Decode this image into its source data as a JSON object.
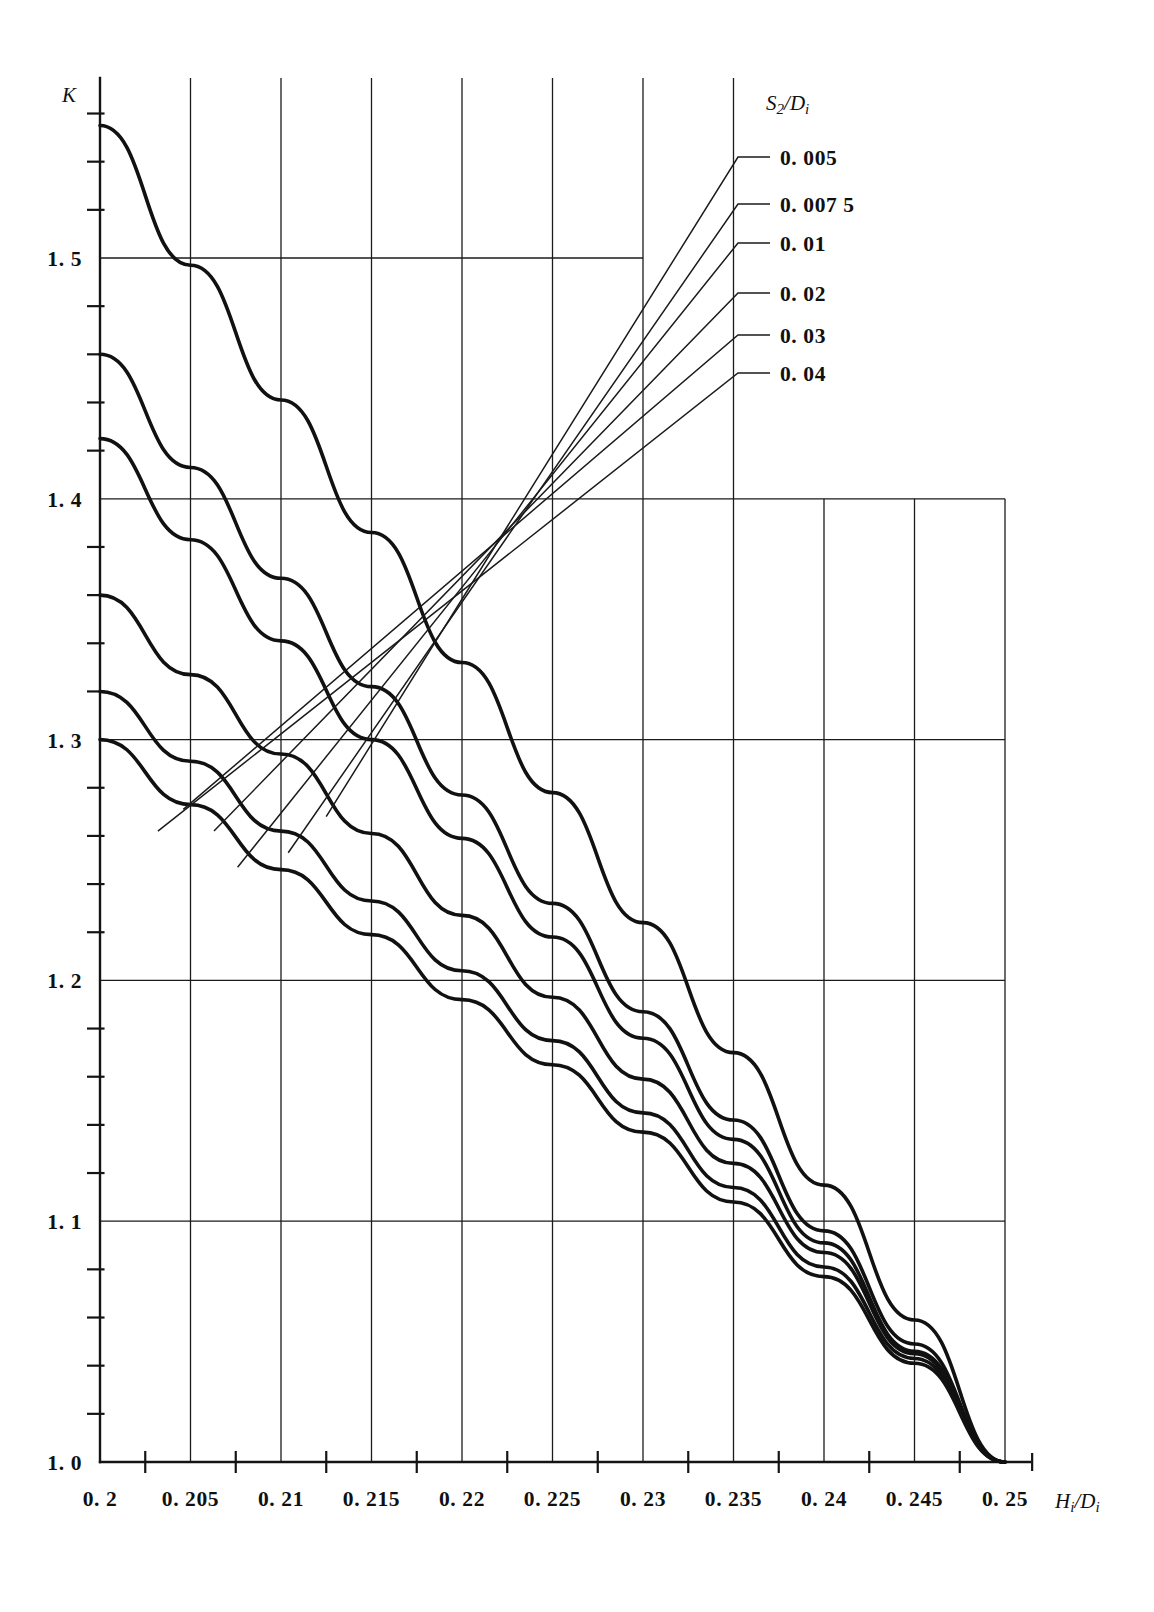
{
  "chart_data": {
    "type": "line",
    "title": "",
    "xlabel": "Hᵢ/Dᵢ",
    "ylabel": "K",
    "xlim": [
      0.2,
      0.25
    ],
    "ylim": [
      1.0,
      1.56
    ],
    "grid": true,
    "legend_position": "upper-right",
    "legend_title": "S₂/Dᵢ",
    "x_major_ticks": [
      0.2,
      0.205,
      0.21,
      0.215,
      0.22,
      0.225,
      0.23,
      0.235,
      0.24,
      0.245,
      0.25
    ],
    "x_tick_labels": [
      "0. 2",
      "0. 205",
      "0. 21",
      "0. 215",
      "0. 22",
      "0. 225",
      "0. 23",
      "0. 235",
      "0. 24",
      "0. 245",
      "0. 25"
    ],
    "x_minor_ticks": [
      0.2025,
      0.2075,
      0.2125,
      0.2175,
      0.2225,
      0.2275,
      0.2325,
      0.2375,
      0.2425,
      0.2475
    ],
    "y_major_ticks": [
      1.0,
      1.1,
      1.2,
      1.3,
      1.4,
      1.5
    ],
    "y_tick_labels": [
      "1. 0",
      "1. 1",
      "1. 2",
      "1. 3",
      "1. 4",
      "1. 5"
    ],
    "y_minor_tick_step": 0.02,
    "series": [
      {
        "name": "0. 005",
        "legend_label": "0. 005",
        "x": [
          0.2,
          0.205,
          0.21,
          0.215,
          0.22,
          0.225,
          0.23,
          0.235,
          0.24,
          0.245,
          0.25
        ],
        "values": [
          1.555,
          1.497,
          1.441,
          1.386,
          1.332,
          1.278,
          1.224,
          1.17,
          1.115,
          1.059,
          1.0
        ]
      },
      {
        "name": "0. 007 5",
        "legend_label": "0. 007 5",
        "x": [
          0.2,
          0.205,
          0.21,
          0.215,
          0.22,
          0.225,
          0.23,
          0.235,
          0.24,
          0.245,
          0.25
        ],
        "values": [
          1.46,
          1.413,
          1.367,
          1.322,
          1.277,
          1.232,
          1.187,
          1.142,
          1.096,
          1.049,
          1.0
        ]
      },
      {
        "name": "0. 01",
        "legend_label": "0. 01",
        "x": [
          0.2,
          0.205,
          0.21,
          0.215,
          0.22,
          0.225,
          0.23,
          0.235,
          0.24,
          0.245,
          0.25
        ],
        "values": [
          1.425,
          1.383,
          1.341,
          1.3,
          1.259,
          1.218,
          1.176,
          1.134,
          1.091,
          1.046,
          1.0
        ]
      },
      {
        "name": "0. 02",
        "legend_label": "0. 02",
        "x": [
          0.2,
          0.205,
          0.21,
          0.215,
          0.22,
          0.225,
          0.23,
          0.235,
          0.24,
          0.245,
          0.25
        ],
        "values": [
          1.36,
          1.327,
          1.294,
          1.261,
          1.227,
          1.193,
          1.159,
          1.124,
          1.087,
          1.045,
          1.0
        ]
      },
      {
        "name": "0. 03",
        "legend_label": "0. 03",
        "x": [
          0.2,
          0.205,
          0.21,
          0.215,
          0.22,
          0.225,
          0.23,
          0.235,
          0.24,
          0.245,
          0.25
        ],
        "values": [
          1.32,
          1.291,
          1.262,
          1.233,
          1.204,
          1.175,
          1.145,
          1.114,
          1.081,
          1.043,
          1.0
        ]
      },
      {
        "name": "0. 04",
        "legend_label": "0. 04",
        "x": [
          0.2,
          0.205,
          0.21,
          0.215,
          0.22,
          0.225,
          0.23,
          0.235,
          0.24,
          0.245,
          0.25
        ],
        "values": [
          1.3,
          1.273,
          1.246,
          1.219,
          1.192,
          1.165,
          1.137,
          1.108,
          1.077,
          1.041,
          1.0
        ]
      }
    ],
    "legend_entries": [
      "0. 005",
      "0. 007 5",
      "0. 01",
      "0. 02",
      "0. 03",
      "0. 04"
    ],
    "colors": {
      "curve": "#111111",
      "grid": "#1b1b1b",
      "axis": "#141414",
      "background": "#ffffff"
    }
  },
  "axes": {
    "y_axis_symbol": "K",
    "x_axis_symbol_main": "H",
    "x_axis_symbol_main_sub": "i",
    "x_axis_symbol_denom": "D",
    "x_axis_symbol_denom_sub": "i",
    "x_axis_slash": "/"
  },
  "legend": {
    "title_main": "S",
    "title_main_sub": "2",
    "title_slash": "/",
    "title_denom": "D",
    "title_denom_sub": "i"
  }
}
